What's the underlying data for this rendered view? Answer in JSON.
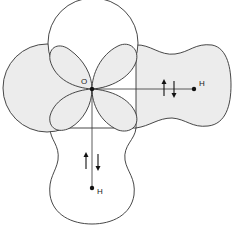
{
  "diagram": {
    "title": "",
    "colors": {
      "fill": "#ececec",
      "stroke": "#333333",
      "background": "#ffffff"
    },
    "atoms": [
      {
        "id": "oxygen",
        "label": "O",
        "x": 92,
        "y": 89
      },
      {
        "id": "hydrogen-right",
        "label": "H",
        "x": 194,
        "y": 89
      },
      {
        "id": "hydrogen-bottom",
        "label": "H",
        "x": 92,
        "y": 188
      }
    ],
    "bonds": [
      {
        "from": "oxygen",
        "to": "hydrogen-right",
        "spins": [
          "up",
          "down"
        ]
      },
      {
        "from": "oxygen",
        "to": "hydrogen-bottom",
        "spins": [
          "up",
          "down"
        ]
      }
    ],
    "orbitals": [
      {
        "name": "top-lone-pair-circle",
        "shaded": false
      },
      {
        "name": "left-lone-pair-circle",
        "shaded": true
      },
      {
        "name": "right-bonding-lobe",
        "shaded": true
      },
      {
        "name": "bottom-bonding-lobe",
        "shaded": false
      },
      {
        "name": "petal-upper-left",
        "shaded": true
      },
      {
        "name": "petal-upper-right",
        "shaded": true
      },
      {
        "name": "petal-lower-left",
        "shaded": true
      },
      {
        "name": "petal-lower-right",
        "shaded": true
      }
    ]
  }
}
